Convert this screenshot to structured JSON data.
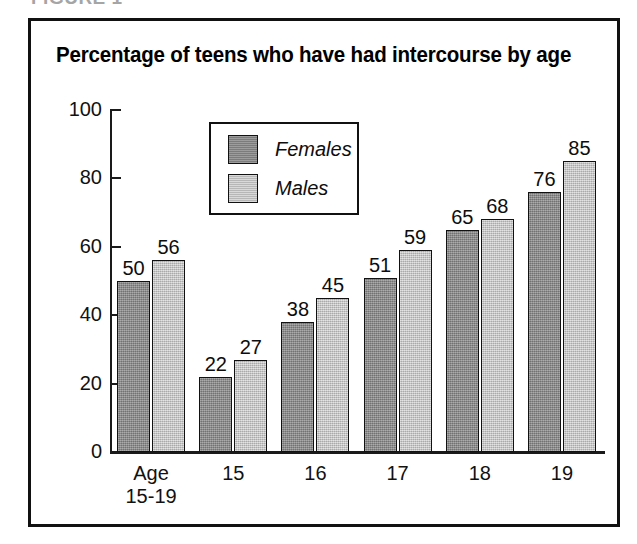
{
  "figure": {
    "caption": "FIGURE 1"
  },
  "chart_data": {
    "type": "bar",
    "title": "Percentage of teens who have had intercourse by age",
    "xlabel": "",
    "ylabel": "",
    "ylim": [
      0,
      100
    ],
    "yticks": [
      0,
      20,
      40,
      60,
      80,
      100
    ],
    "grid": false,
    "legend_position": "top-center",
    "categories": [
      "Age\n15-19",
      "15",
      "16",
      "17",
      "18",
      "19"
    ],
    "series": [
      {
        "name": "Females",
        "color": "#8a8a8a",
        "values": [
          50,
          22,
          38,
          51,
          65,
          76
        ]
      },
      {
        "name": "Males",
        "color": "#c9c9c9",
        "values": [
          56,
          27,
          45,
          59,
          68,
          85
        ]
      }
    ]
  }
}
